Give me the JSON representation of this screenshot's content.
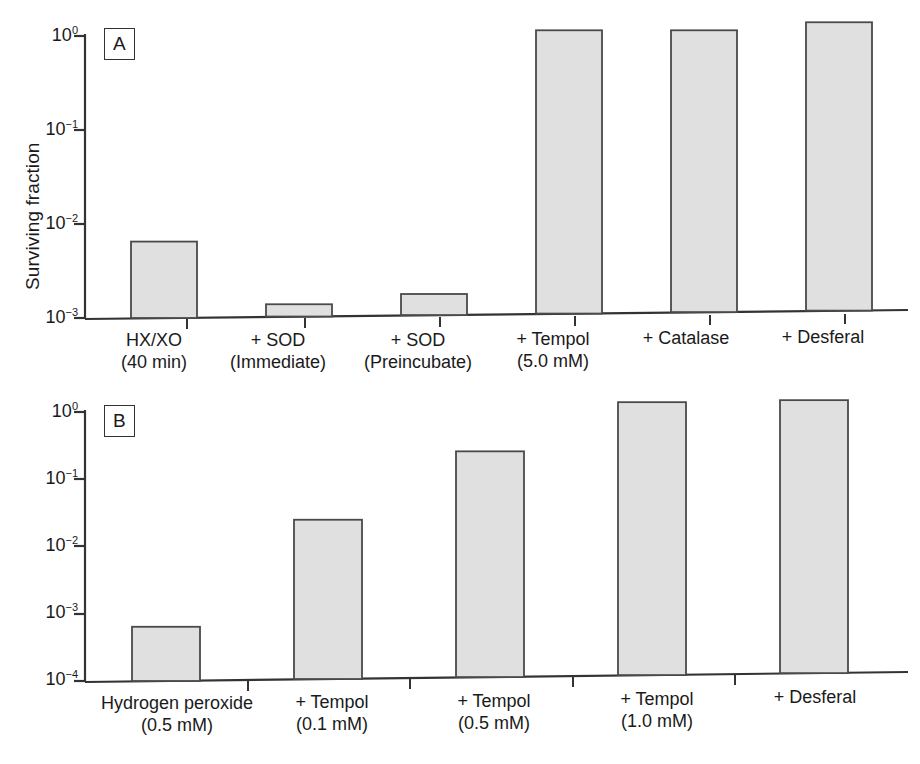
{
  "figure": {
    "background": "#ffffff",
    "bar_fill": "#e0e0e0",
    "bar_stroke": "#4a4a4a",
    "axis_color": "#333333"
  },
  "chart_data": [
    {
      "type": "bar",
      "panel": "A",
      "title": "",
      "xlabel": "",
      "ylabel": "Surviving fraction",
      "yscale": "log",
      "ylim": [
        0.001,
        1.6
      ],
      "yticks": [
        1,
        0.1,
        0.01,
        0.001
      ],
      "ytick_labels": [
        "10 0",
        "10 -1",
        "10 -2",
        "10 -3"
      ],
      "grid": false,
      "legend": "none",
      "categories": [
        "HX/XO (40 min)",
        "+ SOD (Immediate)",
        "+ SOD (Preincubate)",
        "+ Tempol (5.0 mM)",
        "+ Catalase",
        "+ Desferal"
      ],
      "category_lines": [
        [
          "HX/XO",
          "(40 min)"
        ],
        [
          "+ SOD",
          "(Immediate)"
        ],
        [
          "+ SOD",
          "(Preincubate)"
        ],
        [
          "+ Tempol",
          "(5.0 mM)"
        ],
        [
          "+ Catalase",
          ""
        ],
        [
          "+ Desferal",
          ""
        ]
      ],
      "values": [
        0.0065,
        0.0014,
        0.0018,
        1.15,
        1.15,
        1.4
      ]
    },
    {
      "type": "bar",
      "panel": "B",
      "title": "",
      "xlabel": "",
      "ylabel": "Surviving fraction",
      "yscale": "log",
      "ylim": [
        0.0001,
        1.7
      ],
      "yticks": [
        1,
        0.1,
        0.01,
        0.001,
        0.0001
      ],
      "ytick_labels": [
        "10 0",
        "10 -1",
        "10 -2",
        "10 -3",
        "10 -4"
      ],
      "grid": false,
      "legend": "none",
      "categories": [
        "Hydrogen peroxide (0.5 mM)",
        "+ Tempol (0.1 mM)",
        "+ Tempol (0.5 mM)",
        "+ Tempol (1.0 mM)",
        "+ Desferal"
      ],
      "category_lines": [
        [
          "Hydrogen peroxide",
          "(0.5 mM)"
        ],
        [
          "+ Tempol",
          "(0.1 mM)"
        ],
        [
          "+ Tempol",
          "(0.5 mM)"
        ],
        [
          "+ Tempol",
          "(1.0 mM)"
        ],
        [
          "+ Desferal",
          ""
        ]
      ],
      "values": [
        0.00064,
        0.025,
        0.26,
        1.4,
        1.5
      ]
    }
  ],
  "panel_a": {
    "tag": "A",
    "ylabel": "Surviving fraction",
    "ticks": [
      {
        "base": "10",
        "exp": "0"
      },
      {
        "base": "10",
        "exp": "−1"
      },
      {
        "base": "10",
        "exp": "−2"
      },
      {
        "base": "10",
        "exp": "−3"
      }
    ],
    "categories": [
      {
        "line1": "HX/XO",
        "line2": "(40 min)"
      },
      {
        "line1": "+ SOD",
        "line2": "(Immediate)"
      },
      {
        "line1": "+ SOD",
        "line2": "(Preincubate)"
      },
      {
        "line1": "+ Tempol",
        "line2": "(5.0 mM)"
      },
      {
        "line1": "+ Catalase",
        "line2": ""
      },
      {
        "line1": "+ Desferal",
        "line2": ""
      }
    ]
  },
  "panel_b": {
    "tag": "B",
    "ylabel": "Surviving fraction",
    "ticks": [
      {
        "base": "10",
        "exp": "0"
      },
      {
        "base": "10",
        "exp": "−1"
      },
      {
        "base": "10",
        "exp": "−2"
      },
      {
        "base": "10",
        "exp": "−3"
      },
      {
        "base": "10",
        "exp": "−4"
      }
    ],
    "categories": [
      {
        "line1": "Hydrogen peroxide",
        "line2": "(0.5 mM)"
      },
      {
        "line1": "+ Tempol",
        "line2": "(0.1 mM)"
      },
      {
        "line1": "+ Tempol",
        "line2": "(0.5 mM)"
      },
      {
        "line1": "+ Tempol",
        "line2": "(1.0 mM)"
      },
      {
        "line1": "+ Desferal",
        "line2": ""
      }
    ]
  }
}
